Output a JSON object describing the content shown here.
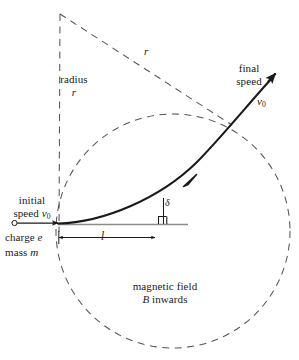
{
  "figure": {
    "colors": {
      "ink": "#1a1a1a",
      "dashed": "#55555a",
      "baseline": "#8c8c8c",
      "background": "#ffffff"
    },
    "labels": {
      "radius_vertical": {
        "line1": "radius",
        "line2": "r"
      },
      "radius_slant": "r",
      "final_speed": {
        "line1": "final",
        "line2": "speed",
        "symbol": "v",
        "subscript": "0"
      },
      "initial_speed": {
        "line1": "initial",
        "line2_prefix": "speed",
        "symbol": "v",
        "subscript": "0"
      },
      "charge": {
        "prefix": "charge",
        "symbol": "e"
      },
      "mass": {
        "prefix": "mass",
        "symbol": "m"
      },
      "length": "l",
      "angle": "δ",
      "magnetic_field": {
        "line1": "magnetic field",
        "line2_symbol": "B",
        "line2_text": " inwards"
      }
    },
    "geometry": {
      "circle_center": [
        173,
        231
      ],
      "circle_radius": 117,
      "entry_point": [
        58,
        224
      ],
      "apex_point": [
        60,
        14
      ],
      "exit_point": [
        229,
        122
      ],
      "arrow_tip": [
        276,
        73
      ],
      "baseline_y": 224,
      "baseline_x_start": 58,
      "baseline_x_end": 188,
      "dimension_y": 237,
      "dimension_x_start": 58,
      "dimension_x_end": 155,
      "delta_vertical_x": 163,
      "delta_vertical_y_top": 198,
      "source_dot": [
        14,
        223
      ]
    }
  }
}
